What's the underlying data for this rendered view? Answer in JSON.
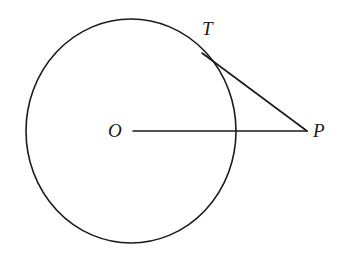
{
  "figure": {
    "background_color": "#ffffff",
    "stroke_color": "#1a1a1a",
    "label_color": "#1a1a1a",
    "width": 346,
    "height": 256
  },
  "labels": {
    "center": "O",
    "tangent_point": "T",
    "external_point": "P"
  },
  "chart_data": {
    "type": "diagram",
    "shapes": [
      {
        "name": "circle",
        "kind": "ellipse",
        "cx": 131,
        "cy": 131,
        "rx": 105,
        "ry": 112,
        "stroke": "#1a1a1a",
        "stroke_width": 1.6,
        "fill": "none"
      },
      {
        "name": "radius-segment-OP",
        "kind": "line",
        "x1": 133,
        "y1": 131,
        "x2": 307,
        "y2": 131,
        "stroke": "#1a1a1a",
        "stroke_width": 1.6
      },
      {
        "name": "tangent-segment-TP",
        "kind": "line",
        "x1": 202,
        "y1": 53,
        "x2": 307,
        "y2": 131,
        "stroke": "#1a1a1a",
        "stroke_width": 1.6
      }
    ],
    "points": [
      {
        "name": "O",
        "label": "O",
        "x": 131,
        "y": 131,
        "role": "circle-center"
      },
      {
        "name": "T",
        "label": "T",
        "x": 202,
        "y": 53,
        "role": "tangent-point"
      },
      {
        "name": "P",
        "label": "P",
        "x": 307,
        "y": 131,
        "role": "external-point"
      }
    ],
    "annotations": [],
    "grid": false,
    "legend": null
  }
}
